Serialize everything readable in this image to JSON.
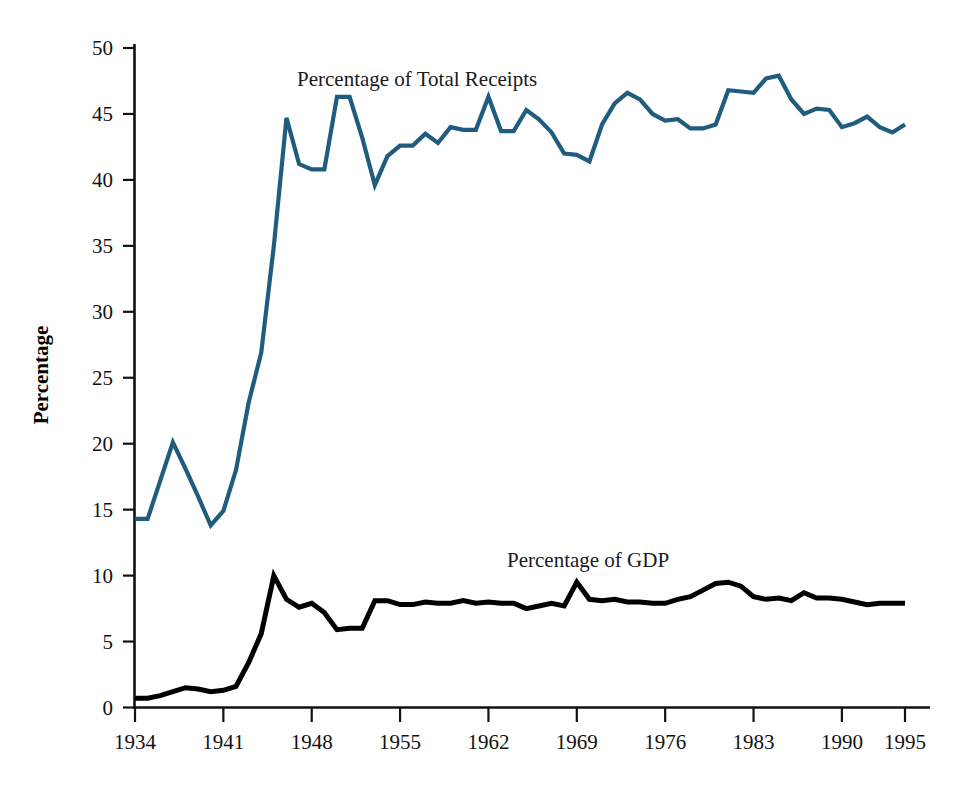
{
  "chart_data": {
    "type": "line",
    "title": "",
    "xlabel": "",
    "ylabel": "Percentage",
    "xlim": [
      1934,
      1995
    ],
    "ylim": [
      0,
      50
    ],
    "grid": false,
    "legend_position": "inline-annotation",
    "x_ticks": [
      1934,
      1941,
      1948,
      1955,
      1962,
      1969,
      1976,
      1983,
      1990,
      1995
    ],
    "y_ticks": [
      0,
      5,
      10,
      15,
      20,
      25,
      30,
      35,
      40,
      45,
      50
    ],
    "x": [
      1934,
      1935,
      1936,
      1937,
      1938,
      1939,
      1940,
      1941,
      1942,
      1943,
      1944,
      1945,
      1946,
      1947,
      1948,
      1949,
      1950,
      1951,
      1952,
      1953,
      1954,
      1955,
      1956,
      1957,
      1958,
      1959,
      1960,
      1961,
      1962,
      1963,
      1964,
      1965,
      1966,
      1967,
      1968,
      1969,
      1970,
      1971,
      1972,
      1973,
      1974,
      1975,
      1976,
      1977,
      1978,
      1979,
      1980,
      1981,
      1982,
      1983,
      1984,
      1985,
      1986,
      1987,
      1988,
      1989,
      1990,
      1991,
      1992,
      1993,
      1994,
      1995
    ],
    "series": [
      {
        "name": "Percentage of Total Receipts",
        "color": "#1f5c7e",
        "label_text": "Percentage of Total Receipts",
        "values": [
          14.3,
          14.3,
          17.2,
          20.1,
          18.1,
          16.0,
          13.8,
          14.9,
          18.0,
          23.1,
          26.9,
          35.0,
          44.7,
          41.2,
          40.8,
          40.8,
          46.3,
          46.3,
          43.2,
          39.6,
          41.8,
          42.6,
          42.6,
          43.5,
          42.8,
          44.0,
          43.8,
          43.8,
          46.3,
          43.7,
          43.7,
          45.3,
          44.6,
          43.6,
          42.0,
          41.9,
          41.4,
          44.2,
          45.8,
          46.6,
          46.1,
          45.0,
          44.5,
          44.6,
          43.9,
          43.9,
          44.2,
          46.8,
          46.7,
          46.6,
          47.7,
          47.9,
          46.1,
          45.0,
          45.4,
          45.3,
          44.0,
          44.3,
          44.8,
          44.0,
          43.6,
          44.2
        ]
      },
      {
        "name": "Percentage of GDP",
        "color": "#000000",
        "label_text": "Percentage of GDP",
        "values": [
          0.7,
          0.7,
          0.9,
          1.2,
          1.5,
          1.4,
          1.2,
          1.3,
          1.6,
          3.4,
          5.6,
          10.0,
          8.2,
          7.6,
          7.9,
          7.2,
          5.9,
          6.0,
          6.0,
          8.1,
          8.1,
          7.8,
          7.8,
          8.0,
          7.9,
          7.9,
          8.1,
          7.9,
          8.0,
          7.9,
          7.9,
          7.5,
          7.7,
          7.9,
          7.7,
          9.5,
          8.2,
          8.1,
          8.2,
          8.0,
          8.0,
          7.9,
          7.9,
          8.2,
          8.4,
          8.9,
          9.4,
          9.5,
          9.2,
          8.4,
          8.2,
          8.3,
          8.1,
          8.7,
          8.3,
          8.3,
          8.2,
          8.0,
          7.8,
          7.9,
          7.9,
          7.9
        ]
      }
    ]
  },
  "axis": {
    "y_title": "Percentage",
    "y_tick_labels": [
      "50",
      "45",
      "40",
      "35",
      "30",
      "25",
      "20",
      "15",
      "10",
      "5",
      "0"
    ],
    "x_tick_labels": [
      "1934",
      "1941",
      "1948",
      "1955",
      "1962",
      "1969",
      "1976",
      "1983",
      "1990",
      "1995"
    ]
  },
  "annotations": {
    "receipts_label": "Percentage of Total Receipts",
    "gdp_label": "Percentage of GDP"
  }
}
